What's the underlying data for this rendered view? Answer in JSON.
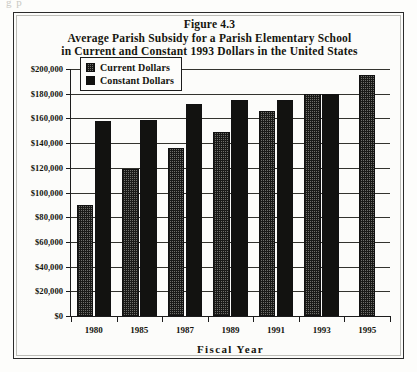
{
  "figure": {
    "frame_border_color": "#2b2b2b",
    "background": "#fcfcfa",
    "scan_artifact": "g  p"
  },
  "title": {
    "line1": "Figure 4.3",
    "line2": "Average Parish Subsidy for a Parish Elementary School",
    "line3": "in Current and Constant 1993 Dollars in the United States"
  },
  "legend": {
    "position": "top-left-inside-plot",
    "entries": [
      {
        "label": "Current Dollars",
        "swatch": "checkered-grey",
        "color": "#6f6f6b"
      },
      {
        "label": "Constant Dollars",
        "swatch": "solid-black",
        "color": "#121210"
      }
    ]
  },
  "axes": {
    "y_tick_labels": [
      "$200,000",
      "$180,000",
      "$160,000",
      "$140,000",
      "$120,000",
      "$100,000",
      "$80,000",
      "$60,000",
      "$40,000",
      "$20,000",
      "$0"
    ],
    "x_tick_labels": [
      "1980",
      "1985",
      "1987",
      "1989",
      "1991",
      "1993",
      "1995"
    ],
    "x_axis_title": "Fiscal Year"
  },
  "chart_data": {
    "type": "bar",
    "title": "Average Parish Subsidy for a Parish Elementary School in Current and Constant 1993 Dollars in the United States",
    "subtitle": "Figure 4.3",
    "xlabel": "Fiscal Year",
    "ylabel": "",
    "ylim": [
      0,
      200000
    ],
    "ytick_step": 20000,
    "grid": true,
    "legend_position": "upper left",
    "categories": [
      "1980",
      "1985",
      "1987",
      "1989",
      "1991",
      "1993",
      "1995"
    ],
    "series": [
      {
        "name": "Current Dollars",
        "color": "#6f6f6b",
        "pattern": "checkered",
        "values": [
          90000,
          119000,
          136000,
          149000,
          166000,
          180000,
          195000
        ]
      },
      {
        "name": "Constant Dollars",
        "color": "#121210",
        "pattern": "solid",
        "values": [
          158000,
          159000,
          172000,
          175000,
          175000,
          180000,
          null
        ]
      }
    ]
  }
}
